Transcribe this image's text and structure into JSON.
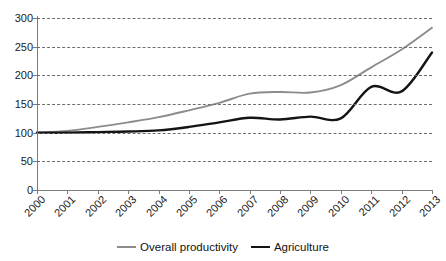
{
  "chart_data": {
    "type": "line",
    "title": "",
    "xlabel": "",
    "ylabel": "",
    "x": [
      "2000",
      "2001",
      "2002",
      "2003",
      "2004",
      "2005",
      "2006",
      "2007",
      "2008",
      "2009",
      "2010",
      "2011",
      "2012",
      "2013"
    ],
    "categories": [
      "2000",
      "2001",
      "2002",
      "2003",
      "2004",
      "2005",
      "2006",
      "2007",
      "2008",
      "2009",
      "2010",
      "2011",
      "2012",
      "2013"
    ],
    "series": [
      {
        "name": "Overall productivity",
        "color": "#8c8c8c",
        "values": [
          100,
          103,
          110,
          118,
          127,
          139,
          152,
          168,
          171,
          170,
          183,
          214,
          245,
          283
        ]
      },
      {
        "name": "Agriculture",
        "color": "#141414",
        "values": [
          100,
          100,
          101,
          102,
          104,
          110,
          118,
          126,
          123,
          128,
          125,
          180,
          172,
          240
        ]
      }
    ],
    "ylim": [
      0,
      300
    ],
    "yticks": [
      0,
      50,
      100,
      150,
      200,
      250,
      300
    ],
    "ytick_labels": [
      "0",
      "50",
      "100",
      "150",
      "200",
      "250",
      "300"
    ],
    "grid": true,
    "grid_style": "dashed-horizontal",
    "legend_position": "bottom-center"
  },
  "legend": {
    "entries": [
      {
        "label": "Overall productivity",
        "color": "#8c8c8c"
      },
      {
        "label": "Agriculture",
        "color": "#141414"
      }
    ]
  }
}
